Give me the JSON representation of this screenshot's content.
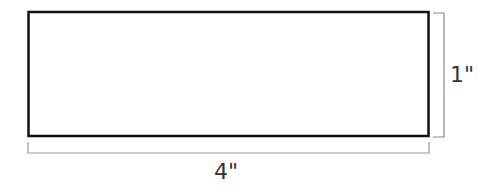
{
  "diagram": {
    "shape": "rectangle",
    "width_label": "4\"",
    "height_label": "1\"",
    "colors": {
      "outline": "#111111",
      "dimension_line": "#888888",
      "label": "#333333",
      "background": "#ffffff"
    }
  }
}
